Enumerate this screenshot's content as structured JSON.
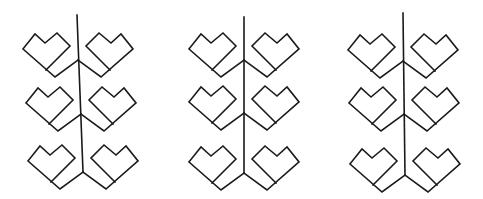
{
  "canvas": {
    "width": 483,
    "height": 199,
    "background": "#ffffff",
    "stroke": "#1a1a1a",
    "stroke_width": 1.6
  },
  "heart_shape": {
    "description": "left-facing heart relative to stem junction (0,0); right hearts are mirrored",
    "points": {
      "left_corner": [
        -55,
        -11
      ],
      "peak_left": [
        -43,
        -26
      ],
      "notch": [
        -33,
        -17
      ],
      "peak_right": [
        -21,
        -27
      ],
      "right_corner": [
        -8,
        -14
      ],
      "inner_joint": [
        -32,
        10
      ],
      "bottom_vertex": [
        -23,
        17
      ]
    }
  },
  "figures": [
    {
      "name": "figure-1",
      "stem": {
        "top": [
          77,
          15
        ],
        "bottom": [
          83,
          172
        ]
      },
      "hearts": [
        {
          "side": "left",
          "junction": [
            78,
            60
          ]
        },
        {
          "side": "right",
          "junction": [
            78,
            60
          ],
          "offset": [
            0,
            0
          ]
        },
        {
          "side": "left",
          "junction": [
            81,
            114
          ]
        },
        {
          "side": "right",
          "junction": [
            81,
            114
          ]
        },
        {
          "side": "left",
          "junction": [
            83,
            172
          ]
        },
        {
          "side": "right",
          "junction": [
            83,
            172
          ]
        }
      ]
    },
    {
      "name": "figure-2",
      "stem": {
        "top": [
          244,
          17
        ],
        "bottom": [
          244,
          173
        ]
      },
      "hearts": [
        {
          "side": "left",
          "junction": [
            244,
            60
          ]
        },
        {
          "side": "right",
          "junction": [
            244,
            60
          ]
        },
        {
          "side": "left",
          "junction": [
            244,
            113
          ]
        },
        {
          "side": "right",
          "junction": [
            244,
            113
          ]
        },
        {
          "side": "left",
          "junction": [
            244,
            173
          ]
        },
        {
          "side": "right",
          "junction": [
            244,
            173
          ]
        }
      ]
    },
    {
      "name": "figure-3",
      "stem": {
        "top": [
          403,
          13
        ],
        "bottom": [
          405,
          175
        ]
      },
      "hearts": [
        {
          "side": "left",
          "junction": [
            403,
            61
          ]
        },
        {
          "side": "right",
          "junction": [
            403,
            61
          ]
        },
        {
          "side": "left",
          "junction": [
            404,
            114
          ]
        },
        {
          "side": "right",
          "junction": [
            404,
            114
          ]
        },
        {
          "side": "left",
          "junction": [
            405,
            175
          ]
        },
        {
          "side": "right",
          "junction": [
            405,
            175
          ]
        }
      ]
    }
  ]
}
